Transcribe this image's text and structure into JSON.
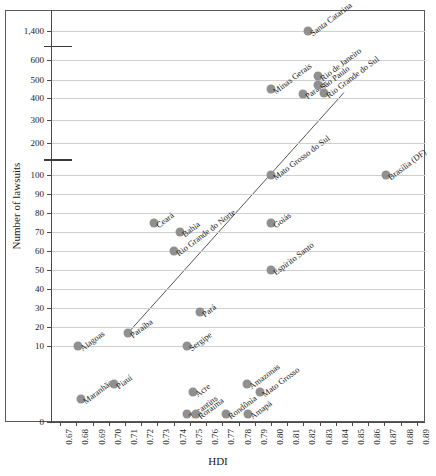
{
  "chart_data": {
    "type": "scatter",
    "title": "",
    "xlabel": "HDI",
    "ylabel": "Number of lawsuits",
    "xlim": [
      0.665,
      0.895
    ],
    "xticks": [
      "0.67",
      "0.68",
      "0.69",
      "0.70",
      "0.71",
      "0.72",
      "0.73",
      "0.74",
      "0.75",
      "0.76",
      "0.77",
      "0.78",
      "0.79",
      "0.80",
      "0.81",
      "0.82",
      "0.83",
      "0.84",
      "0.85",
      "0.86",
      "0.87",
      "0.88",
      "0.89"
    ],
    "yticks": [
      "1,400",
      "600",
      "500",
      "400",
      "300",
      "200",
      "100",
      "90",
      "80",
      "70",
      "60",
      "50",
      "40",
      "30",
      "20",
      "10",
      "0"
    ],
    "y_axis_broken": true,
    "y_break_note": "Axis broken between 1,400 and 600, and between 200 and 100",
    "grid": true,
    "legend": "none",
    "marker_color": "#909090",
    "trendline": {
      "visible": true,
      "x_start": 0.712,
      "y_start": 17,
      "x_end": 0.845,
      "y_end": 430
    },
    "points": [
      {
        "label": "Alagoas",
        "x": 0.681,
        "y": 10
      },
      {
        "label": "Maranhão",
        "x": 0.683,
        "y": 3
      },
      {
        "label": "Piauí",
        "x": 0.703,
        "y": 5
      },
      {
        "label": "Paraíba",
        "x": 0.712,
        "y": 17
      },
      {
        "label": "Ceará",
        "x": 0.728,
        "y": 75
      },
      {
        "label": "Bahia",
        "x": 0.744,
        "y": 70
      },
      {
        "label": "Rio Grande do Norte",
        "x": 0.74,
        "y": 60
      },
      {
        "label": "Tocantins",
        "x": 0.748,
        "y": 1
      },
      {
        "label": "Sergipe",
        "x": 0.748,
        "y": 10
      },
      {
        "label": "Acre",
        "x": 0.752,
        "y": 4
      },
      {
        "label": "Roraima",
        "x": 0.754,
        "y": 1
      },
      {
        "label": "Pará",
        "x": 0.756,
        "y": 28
      },
      {
        "label": "Rondônia",
        "x": 0.772,
        "y": 1
      },
      {
        "label": "Amazonas",
        "x": 0.785,
        "y": 5
      },
      {
        "label": "Amapá",
        "x": 0.786,
        "y": 1
      },
      {
        "label": "Mato Grosso",
        "x": 0.793,
        "y": 4
      },
      {
        "label": "Espírito Santo",
        "x": 0.8,
        "y": 50
      },
      {
        "label": "Goiás",
        "x": 0.8,
        "y": 75
      },
      {
        "label": "Mato Grosso do Sul",
        "x": 0.8,
        "y": 100
      },
      {
        "label": "Minas Gerais",
        "x": 0.8,
        "y": 450
      },
      {
        "label": "Paraná",
        "x": 0.82,
        "y": 420
      },
      {
        "label": "Santa Catarina",
        "x": 0.823,
        "y": 1400
      },
      {
        "label": "Rio de Janeiro",
        "x": 0.829,
        "y": 520
      },
      {
        "label": "São Paulo",
        "x": 0.829,
        "y": 470
      },
      {
        "label": "Rio Grande do Sul",
        "x": 0.833,
        "y": 430
      },
      {
        "label": "Brasília (DF)",
        "x": 0.871,
        "y": 100
      }
    ]
  }
}
